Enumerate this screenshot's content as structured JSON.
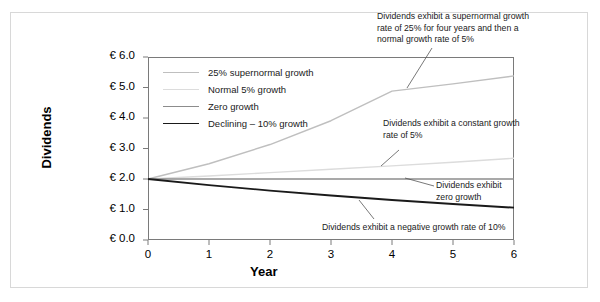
{
  "chart_data": {
    "type": "line",
    "title": "",
    "xlabel": "Year",
    "ylabel": "Dividends",
    "x": [
      0,
      1,
      2,
      3,
      4,
      5,
      6
    ],
    "xlim": [
      0,
      6
    ],
    "ylim": [
      0.0,
      6.0
    ],
    "xticks": [
      "0",
      "1",
      "2",
      "3",
      "4",
      "5",
      "6"
    ],
    "yticks": [
      "€ 0.0",
      "€ 1.0",
      "€ 2.0",
      "€ 3.0",
      "€ 4.0",
      "€ 5.0",
      "€ 6.0"
    ],
    "ytick_values": [
      0.0,
      1.0,
      2.0,
      3.0,
      4.0,
      5.0,
      6.0
    ],
    "grid": false,
    "legend_position": "upper-left-inside",
    "series": [
      {
        "name": "25% supernormal growth",
        "values": [
          2.0,
          2.5,
          3.13,
          3.91,
          4.88,
          5.12,
          5.38
        ],
        "color": "#bfbfbf",
        "width": 1.4
      },
      {
        "name": "Normal 5% growth",
        "values": [
          2.0,
          2.1,
          2.21,
          2.32,
          2.43,
          2.55,
          2.68
        ],
        "color": "#dcdcdc",
        "width": 1.4
      },
      {
        "name": "Zero growth",
        "values": [
          2.0,
          2.0,
          2.0,
          2.0,
          2.0,
          2.0,
          2.0
        ],
        "color": "#8c8c8c",
        "width": 1.4
      },
      {
        "name": "Declining – 10% growth",
        "values": [
          2.0,
          1.8,
          1.62,
          1.46,
          1.31,
          1.18,
          1.06
        ],
        "color": "#1a1a1a",
        "width": 1.9
      }
    ],
    "annotations": [
      {
        "id": "supernormal",
        "text": "Dividends exhibit a supernormal growth\nrate of 25% for four years and then a\nnormal growth rate of 5%"
      },
      {
        "id": "constant",
        "text": "Dividends exhibit a constant growth\n  rate of 5%"
      },
      {
        "id": "zero",
        "text": "Dividends exhibit\n zero growth"
      },
      {
        "id": "negative",
        "text": "Dividends exhibit a negative growth rate of 10%"
      }
    ]
  },
  "legend": {
    "items": [
      {
        "label": "25% supernormal growth"
      },
      {
        "label": "Normal 5% growth"
      },
      {
        "label": "Zero growth"
      },
      {
        "label": "Declining – 10% growth"
      }
    ]
  },
  "colors": {
    "outer_border": "#d8d8d8",
    "plot_border": "#7a7a7a",
    "background": "#ffffff",
    "text": "#1a1a1a"
  }
}
